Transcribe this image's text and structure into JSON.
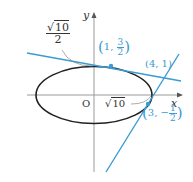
{
  "diagram": {
    "axes": {
      "x_label": "x",
      "y_label": "y",
      "origin_label": "O"
    },
    "ellipse": {
      "a": "√10",
      "b": "√10/2"
    },
    "labels": {
      "y_intercept": {
        "num": "√10",
        "num_radicand": "10",
        "den": "2"
      },
      "x_intercept": {
        "radicand": "10"
      },
      "tangent_point_1": {
        "x": "1",
        "y_num": "3",
        "y_den": "2",
        "sign": ""
      },
      "tangent_point_2": {
        "x": "3",
        "y_num": "1",
        "y_den": "2",
        "sign": "−"
      },
      "intersection": "(4, 1)"
    },
    "colors": {
      "tangent": "#3a9bd5",
      "ellipse": "#222222",
      "axis": "#999999",
      "leader": "#888888"
    }
  }
}
